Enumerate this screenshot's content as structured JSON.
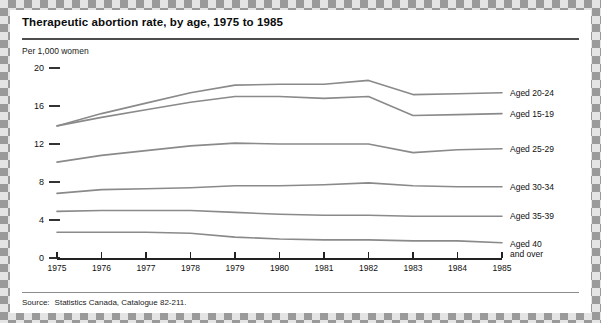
{
  "chart_data": {
    "type": "line",
    "title": "Therapeutic abortion rate, by age, 1975 to 1985",
    "ylabel": "Per 1,000 women",
    "xlabel": "",
    "categories": [
      "1975",
      "1976",
      "1977",
      "1978",
      "1979",
      "1980",
      "1981",
      "1982",
      "1983",
      "1984",
      "1985"
    ],
    "x": [
      1975,
      1976,
      1977,
      1978,
      1979,
      1980,
      1981,
      1982,
      1983,
      1984,
      1985
    ],
    "ylim": [
      0,
      20
    ],
    "yticks": [
      0,
      4,
      8,
      12,
      16,
      20
    ],
    "ytick_labels": [
      "0",
      "4",
      "8",
      "12",
      "16",
      "20"
    ],
    "grid": false,
    "legend_position": "right-inline",
    "series": [
      {
        "name": "Aged 20-24",
        "values": [
          13.9,
          15.2,
          16.3,
          17.4,
          18.2,
          18.3,
          18.3,
          18.7,
          17.2,
          17.3,
          17.4
        ]
      },
      {
        "name": "Aged 15-19",
        "values": [
          13.9,
          14.8,
          15.6,
          16.4,
          17.0,
          17.0,
          16.8,
          17.0,
          15.0,
          15.1,
          15.2
        ]
      },
      {
        "name": "Aged 25-29",
        "values": [
          10.1,
          10.8,
          11.3,
          11.8,
          12.1,
          12.0,
          12.0,
          12.0,
          11.1,
          11.4,
          11.5
        ]
      },
      {
        "name": "Aged 30-34",
        "values": [
          6.8,
          7.2,
          7.3,
          7.4,
          7.6,
          7.6,
          7.7,
          7.9,
          7.6,
          7.5,
          7.5
        ]
      },
      {
        "name": "Aged 35-39",
        "values": [
          4.9,
          5.0,
          5.0,
          5.0,
          4.8,
          4.6,
          4.5,
          4.5,
          4.4,
          4.4,
          4.4
        ]
      },
      {
        "name": "Aged 40 and over",
        "values": [
          2.7,
          2.7,
          2.7,
          2.6,
          2.2,
          2.0,
          1.9,
          1.9,
          1.8,
          1.8,
          1.6
        ]
      }
    ],
    "legend_labels": [
      {
        "line1": "Aged 20-24",
        "line2": ""
      },
      {
        "line1": "Aged 15-19",
        "line2": ""
      },
      {
        "line1": "Aged 25-29",
        "line2": ""
      },
      {
        "line1": "Aged 30-34",
        "line2": ""
      },
      {
        "line1": "Aged 35-39",
        "line2": ""
      },
      {
        "line1": "Aged 40",
        "line2": "and over"
      }
    ],
    "colors": {
      "line": "#8a8a8a",
      "axis": "#222222",
      "title_rule": "#4d4d4d",
      "text": "#111111",
      "border_light": "#e4e4e4",
      "border_dark": "#9a9a9a"
    }
  },
  "source": {
    "key": "Source:",
    "text": "Statistics Canada, Catalogue 82-211."
  }
}
